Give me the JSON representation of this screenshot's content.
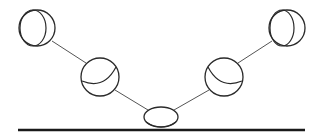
{
  "diagram": {
    "type": "bouncing-ball-sequence",
    "width": 322,
    "height": 136,
    "colors": {
      "background": "#ffffff",
      "stroke": "#2a2a2a",
      "connector": "#555555",
      "ground": "#1a1a1a"
    },
    "ground": {
      "x1": 18,
      "x2": 305,
      "y": 130,
      "thickness": 2.4
    },
    "balls": [
      {
        "id": "ball-top-left",
        "cx": 37,
        "cy": 28,
        "r": 18,
        "inner": {
          "cx": 33,
          "cy": 28,
          "rx": 13,
          "ry": 18
        }
      },
      {
        "id": "ball-mid-left",
        "cx": 100,
        "cy": 77,
        "r": 19,
        "inner_arc": "M 82 81 Q 104 90 116 67"
      },
      {
        "id": "ball-mid-right",
        "cx": 224,
        "cy": 77,
        "r": 19,
        "inner_arc": "M 242 81 Q 220 90 208 67"
      },
      {
        "id": "ball-top-right",
        "cx": 287,
        "cy": 28,
        "r": 18,
        "inner": {
          "cx": 282,
          "cy": 28,
          "rx": 12,
          "ry": 18
        }
      }
    ],
    "squashed_ball": {
      "id": "ball-impact",
      "cx": 161,
      "cy": 117,
      "rx": 17,
      "ry": 10,
      "inner_arc": "M 146 122 Q 161 132 176 122"
    },
    "connectors": [
      {
        "x1": 52,
        "y1": 41,
        "x2": 86,
        "y2": 63
      },
      {
        "x1": 115,
        "y1": 90,
        "x2": 148,
        "y2": 110
      },
      {
        "x1": 174,
        "y1": 110,
        "x2": 209,
        "y2": 90
      },
      {
        "x1": 238,
        "y1": 63,
        "x2": 272,
        "y2": 41
      }
    ]
  }
}
